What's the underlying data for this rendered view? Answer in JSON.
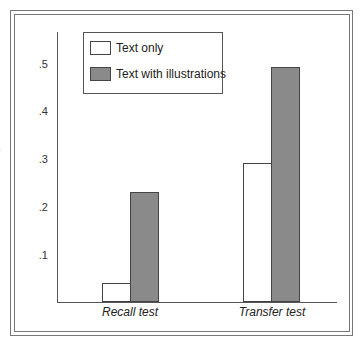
{
  "chart_data": {
    "type": "bar",
    "title": "",
    "xlabel": "",
    "ylabel": "Proportion correct",
    "categories": [
      "Recall test",
      "Transfer test"
    ],
    "series": [
      {
        "name": "Text only",
        "values": [
          0.04,
          0.29
        ],
        "color": "#ffffff"
      },
      {
        "name": "Text with illustrations",
        "values": [
          0.23,
          0.49
        ],
        "color": "#8a8a8a"
      }
    ],
    "ylim": [
      0,
      0.56
    ],
    "yticks": [
      ".1",
      ".2",
      ".3",
      ".4",
      ".5"
    ],
    "grid": false,
    "legend_position": "upper left"
  },
  "axis": {
    "ylabel": "Proportion correct",
    "ticks": [
      ".1",
      ".2",
      ".3",
      ".4",
      ".5"
    ]
  },
  "categories": [
    "Recall test",
    "Transfer test"
  ],
  "legend": {
    "items": [
      {
        "label": "Text only",
        "color": "#ffffff"
      },
      {
        "label": "Text with illustrations",
        "color": "#8a8a8a"
      }
    ]
  }
}
